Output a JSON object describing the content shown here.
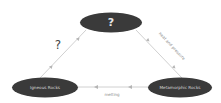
{
  "diagram": {
    "colors": {
      "node_fill": "#3a3a3a",
      "node_text": "#d9d9d9",
      "edge": "#bdbdbd",
      "edge_label": "#8a8a8a",
      "question": "#444444"
    },
    "nodes": [
      {
        "id": "top",
        "label": "?"
      },
      {
        "id": "igneous",
        "label": "Igneous Rocks"
      },
      {
        "id": "metamorphic",
        "label": "Metamorphic Rocks"
      }
    ],
    "edges": [
      {
        "from": "top",
        "to": "metamorphic",
        "label": "heat and pressure"
      },
      {
        "from": "metamorphic",
        "to": "igneous",
        "label": "melting"
      },
      {
        "from": "igneous",
        "to": "top",
        "label": "?"
      }
    ]
  }
}
